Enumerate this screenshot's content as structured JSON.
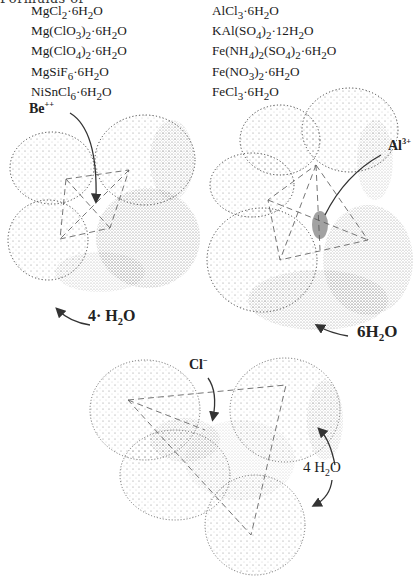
{
  "page": {
    "cut_off_heading": "Formulas of",
    "left_column": [
      {
        "base": "MgCl",
        "parts": [
          "MgCl",
          "2",
          "·6H",
          "2",
          "O"
        ]
      },
      {
        "base": "Mg(ClO3)2",
        "parts": [
          "Mg(ClO",
          "3",
          ")",
          "2",
          "·6H",
          "2",
          "O"
        ]
      },
      {
        "base": "Mg(ClO4)2",
        "parts": [
          "Mg(ClO",
          "4",
          ")",
          "2",
          "·6H",
          "2",
          "O"
        ]
      },
      {
        "base": "MgSiF6",
        "parts": [
          "MgSiF",
          "6",
          "·6H",
          "2",
          "O"
        ]
      },
      {
        "base": "NiSnCl6",
        "parts": [
          "NiSnCl",
          "6",
          "·6H",
          "2",
          "O"
        ]
      }
    ],
    "right_column": [
      {
        "base": "AlCl3",
        "parts": [
          "AlCl",
          "3",
          "·6H",
          "2",
          "O"
        ]
      },
      {
        "base": "KAl(SO4)2",
        "parts": [
          "KAl(SO",
          "4",
          ")",
          "2",
          "·12H",
          "2",
          "O"
        ]
      },
      {
        "base": "Fe(NH4)2(SO4)2",
        "parts": [
          "Fe(NH",
          "4",
          ")",
          "2",
          "(SO",
          "4",
          ")",
          "2",
          "·6H",
          "2",
          "O"
        ]
      },
      {
        "base": "Fe(NO3)2",
        "parts": [
          "Fe(NO",
          "3",
          ")",
          "2",
          "·6H",
          "2",
          "O"
        ]
      },
      {
        "base": "FeCl3",
        "parts": [
          "FeCl",
          "3",
          "·6H",
          "2",
          "O"
        ]
      }
    ]
  },
  "figures": {
    "beryllium": {
      "ion_label": "Be",
      "ion_charge": "++",
      "water_count": "4·",
      "water_label_h": "H",
      "water_label_sub": "2",
      "water_label_o": "O"
    },
    "aluminum": {
      "ion_label": "Al",
      "ion_charge": "3+",
      "water_count": "6",
      "water_label_h": "H",
      "water_label_sub": "2",
      "water_label_o": "O"
    },
    "chloride": {
      "ion_label": "Cl",
      "ion_charge": "−",
      "water_count": "4",
      "water_label_h": "H",
      "water_label_sub": "2",
      "water_label_o": "O"
    }
  },
  "colors": {
    "ink": "#1a1a1a",
    "stipple": "#555555",
    "dash": "#666666",
    "paper": "#ffffff"
  }
}
